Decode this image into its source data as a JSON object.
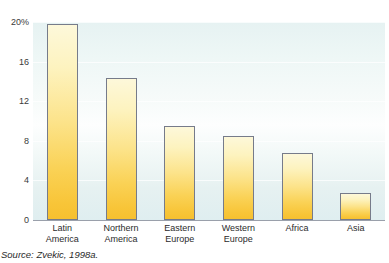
{
  "figure": {
    "title_remnant": "",
    "source_note": "Source: Zvekic, 1998a."
  },
  "colors": {
    "bar_top": "#fdf8da",
    "bar_bottom": "#f6c02f",
    "bar_border": "#767b8a",
    "plot_background": "#e9f4f3",
    "axis_line": "#9aa0ab",
    "text": "#2b2b2b"
  },
  "chart_data": {
    "type": "bar",
    "title": "",
    "xlabel": "",
    "ylabel": "",
    "categories": [
      "Latin America",
      "Northern America",
      "Eastern Europe",
      "Western Europe",
      "Africa",
      "Asia"
    ],
    "category_lines": [
      [
        "Latin",
        "America"
      ],
      [
        "Northern",
        "America"
      ],
      [
        "Eastern",
        "Europe"
      ],
      [
        "Western",
        "Europe"
      ],
      [
        "Africa",
        ""
      ],
      [
        "Asia",
        ""
      ]
    ],
    "values": [
      19.8,
      14.3,
      9.5,
      8.5,
      6.8,
      2.7
    ],
    "ylim": [
      0,
      20
    ],
    "yticks": [
      0,
      4,
      8,
      12,
      16,
      20
    ],
    "ytick_labels": [
      "0",
      "4",
      "8",
      "12",
      "16",
      "20%"
    ],
    "grid": true,
    "legend": null,
    "units": "percent"
  }
}
